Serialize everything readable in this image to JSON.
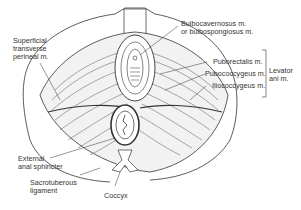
{
  "figure": {
    "colors": {
      "ink": "#333333",
      "background": "#ffffff",
      "muscle_fill": "#f2f2f2"
    }
  },
  "labels": {
    "superficial_transverse_perineal": [
      "Superficial",
      "transverse",
      "perineal m."
    ],
    "bulbocavernosus": [
      "Bulbocavernosus m.",
      "or bulbospongiosus m."
    ],
    "puborectalis": "Puborectalis m.",
    "pubococcygeus": "Pubococcygeus m.",
    "iliococcygeus": "Iliococcygeus m.",
    "levator_ani": [
      "Levator",
      "ani m."
    ],
    "external_anal_sphincter": [
      "External",
      "anal sphincter"
    ],
    "sacrotuberous_ligament": [
      "Sacrotuberous",
      "ligament"
    ],
    "coccyx": "Coccyx"
  }
}
